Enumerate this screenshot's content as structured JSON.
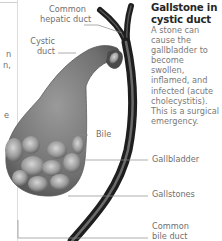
{
  "figure": {
    "title": "Gallstone in cystic duct",
    "title_lines": [
      "Gallstone in",
      "cystic duct"
    ],
    "description_lines": [
      "A stone can",
      "cause the",
      "gallbladder to",
      "become",
      "swollen,",
      "inflamed, and",
      "infected (acute",
      "cholecystitis).",
      "This is a surgical",
      "emergency."
    ],
    "labels": {
      "common_hepatic_duct": [
        "Common",
        "hepatic duct"
      ],
      "cystic_duct": [
        "Cystic",
        "duct"
      ],
      "bile": "Bile",
      "gallbladder": "Gallbladder",
      "gallstones": "Gallstones",
      "common_bile_duct": [
        "Common",
        "bile duct"
      ]
    },
    "left_fragments": [
      "n",
      "n,",
      "e"
    ],
    "colors": {
      "title": "#262626",
      "text": "#7a7a7a",
      "duct": "#2a2a2a",
      "gallbladder": "#7d7d7d",
      "stone": "#9a9a9a",
      "leader": "#8a8a8a"
    }
  }
}
